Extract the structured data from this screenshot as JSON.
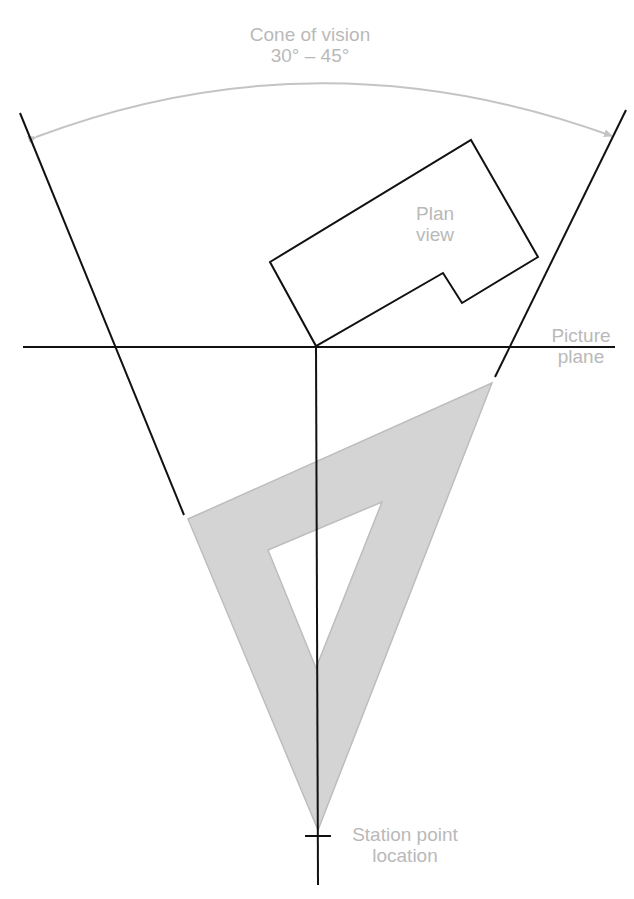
{
  "labels": {
    "cone_line1": "Cone of vision",
    "cone_line2": "30° – 45°",
    "plan_line1": "Plan",
    "plan_line2": "view",
    "picture_line1": "Picture",
    "picture_line2": "plane",
    "station_line1": "Station point",
    "station_line2": "location"
  },
  "colors": {
    "line": "#111111",
    "label": "#b9b9b9",
    "triangle_fill": "#d4d4d4",
    "triangle_stroke": "#bdbdbd",
    "arc": "#c4c4c4"
  }
}
